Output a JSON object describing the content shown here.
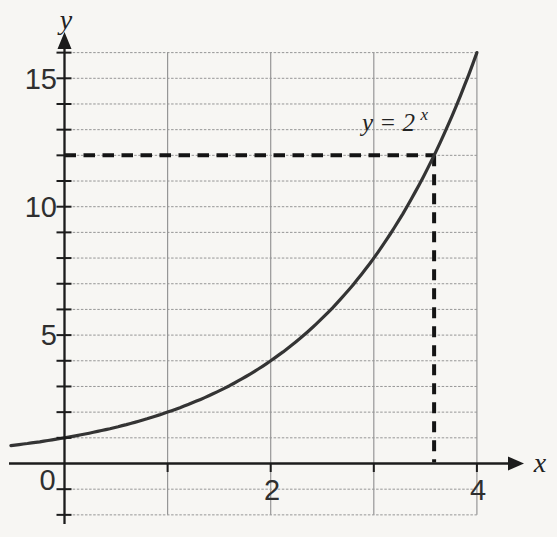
{
  "page": {
    "background_color": "#f7f6f3"
  },
  "chart_data": {
    "type": "line",
    "title": "",
    "grid": "on",
    "legend": "none",
    "axes": {
      "xlabel": "x",
      "ylabel": "y",
      "x_grid_range": [
        0,
        4
      ],
      "y_grid_range": [
        -2,
        16
      ],
      "grid_step_x": 1,
      "grid_step_y": 1,
      "x_axis_arrow": "right",
      "y_axis_arrow": "up",
      "x_tick_marks": [
        1,
        2,
        3,
        4
      ],
      "y_tick_marks_step": 1,
      "x_tick_labels": [
        {
          "value": 0,
          "label": "0"
        },
        {
          "value": 2,
          "label": "2"
        },
        {
          "value": 4,
          "label": "4"
        }
      ],
      "y_tick_labels": [
        {
          "value": 15,
          "label": "15"
        },
        {
          "value": 10,
          "label": "10"
        },
        {
          "value": 5,
          "label": "5"
        }
      ]
    },
    "series": [
      {
        "name": "y = 2^x",
        "function": "2^x",
        "base": 2,
        "x_domain": [
          -0.52,
          4
        ],
        "points": [
          [
            -0.5,
            0.71
          ],
          [
            0,
            1
          ],
          [
            0.5,
            1.41
          ],
          [
            1,
            2
          ],
          [
            1.5,
            2.83
          ],
          [
            2,
            4
          ],
          [
            2.5,
            5.66
          ],
          [
            3,
            8
          ],
          [
            3.5,
            11.31
          ],
          [
            3.58,
            12
          ],
          [
            4,
            16
          ]
        ]
      }
    ],
    "annotations": {
      "curve_label": {
        "base_text": "y = 2",
        "exponent_text": "x",
        "full_text": "y = 2^x"
      },
      "dashed_guide": {
        "y_value": 12,
        "x_value": 3.58
      }
    },
    "colors": {
      "axis": "#1c1c1c",
      "grid": "#969696",
      "curve": "#343434",
      "dashed_guide": "#141414",
      "text": "#2f2f2f"
    }
  }
}
